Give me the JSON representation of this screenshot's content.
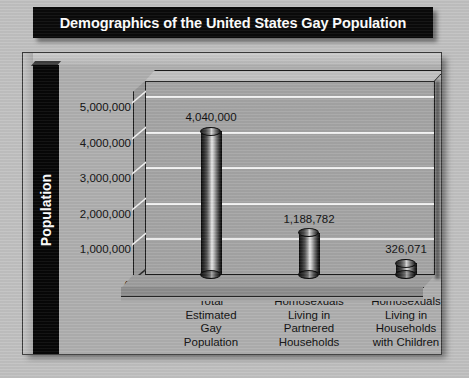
{
  "title": "Demographics of the United States Gay Population",
  "colors": {
    "page_background": "#c2c2c2",
    "title_background": "#0a0a0a",
    "title_text": "#ffffff",
    "frame_background": "#b0b0b0",
    "plot_wall": "#a6a6a6",
    "gridline": "#f2f2f2",
    "axis_band": "#070707",
    "label_text": "#111111"
  },
  "chart_data": {
    "type": "bar",
    "title": "Demographics of the United States Gay Population",
    "subtitle": "",
    "xlabel": "",
    "ylabel": "Population",
    "categories": [
      "Total Estimated Gay Population",
      "Homosexuals Living in Partnered Households",
      "Homosexuals Living in Households with Children"
    ],
    "category_lines": [
      [
        "Total",
        "Estimated",
        "Gay",
        "Population"
      ],
      [
        "Homosexuals",
        "Living in",
        "Partnered",
        "Households"
      ],
      [
        "Homosexuals",
        "Living in",
        "Households",
        "with Children"
      ]
    ],
    "values": [
      4040000,
      1188782,
      326071
    ],
    "value_labels": [
      "4,040,000",
      "1,188,782",
      "326,071"
    ],
    "ylim": [
      0,
      5000000
    ],
    "ytick_values": [
      5000000,
      4000000,
      3000000,
      2000000,
      1000000,
      0
    ],
    "ytick_labels": [
      "5,000,000",
      "4,000,000",
      "3,000,000",
      "2,000,000",
      "1,000,000",
      "0"
    ],
    "grid": true,
    "legend": false,
    "legend_position": "none",
    "style": "3d-cylinder-bars",
    "bar_style": "metallic grayscale cylinder"
  }
}
